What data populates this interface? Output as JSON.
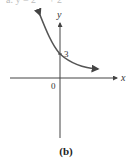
{
  "header": {
    "cropped_equation": "a. y = 2 ⁻ˣ + 2"
  },
  "graph": {
    "y_axis_label": "y",
    "x_axis_label": "x",
    "origin_label": "0",
    "y_intercept_label": "3",
    "curve_color": "#555555",
    "axis_color": "#444444"
  },
  "caption": "(b)"
}
